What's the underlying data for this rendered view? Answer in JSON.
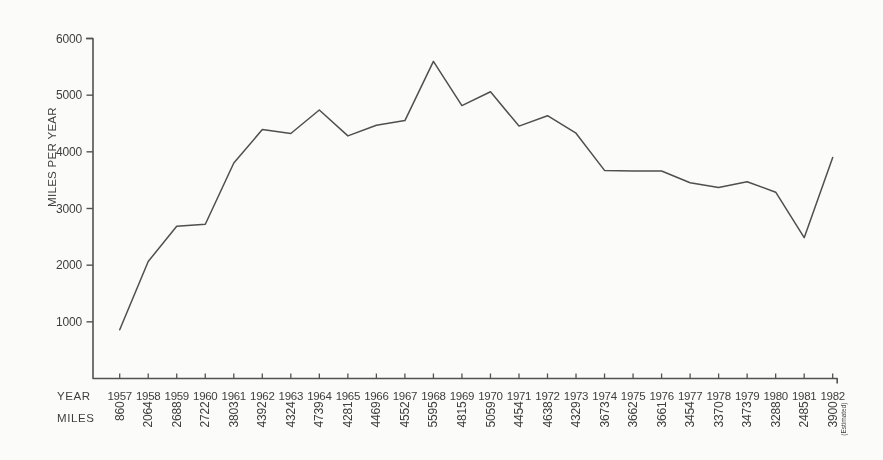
{
  "chart_data": {
    "type": "line",
    "title": "",
    "ylabel": "MILES PER YEAR",
    "row_headers": {
      "year": "YEAR",
      "miles": "MILES"
    },
    "x": [
      "1957",
      "1958",
      "1959",
      "1960",
      "1961",
      "1962",
      "1963",
      "1964",
      "1965",
      "1966",
      "1967",
      "1968",
      "1969",
      "1970",
      "1971",
      "1972",
      "1973",
      "1974",
      "1975",
      "1976",
      "1977",
      "1978",
      "1979",
      "1980",
      "1981",
      "1982"
    ],
    "values": [
      860,
      2064,
      2688,
      2722,
      3803,
      4392,
      4324,
      4739,
      4281,
      4469,
      4552,
      5595,
      4815,
      5059,
      4454,
      4638,
      4329,
      3673,
      3662,
      3661,
      3454,
      3370,
      3473,
      3288,
      2485,
      3900
    ],
    "value_labels": [
      "860",
      "2064",
      "2688",
      "2722",
      "3803",
      "4392",
      "4324",
      "4739",
      "4281",
      "4469",
      "4552",
      "5595",
      "4815",
      "5059",
      "4454",
      "4638",
      "4329",
      "3673",
      "3662",
      "3661",
      "3454",
      "3370",
      "3473",
      "3288",
      "2485",
      "3900"
    ],
    "last_point_note": "(Estimated)",
    "ylim": [
      0,
      6000
    ],
    "yticks": [
      1000,
      2000,
      3000,
      4000,
      5000,
      6000
    ],
    "ytick_labels": [
      "1000",
      "2000",
      "3000",
      "4000",
      "5000",
      "6000"
    ],
    "grid": false,
    "legend": "none",
    "line_color": "#4f4f4f",
    "axis_color": "#525252",
    "text_color": "#3e3e3e",
    "background_color": "#fbfbf9"
  }
}
